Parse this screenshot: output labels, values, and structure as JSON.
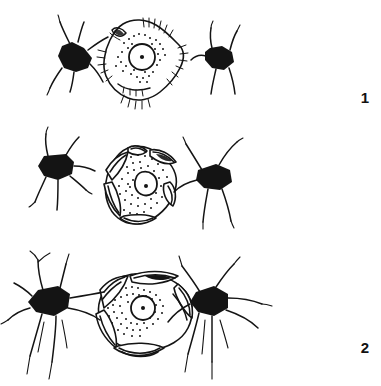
{
  "figure": {
    "background_color": "#ffffff",
    "ink_color": "#141414",
    "width": 381,
    "height": 386,
    "style": "black-and-white line drawing"
  },
  "panels": [
    {
      "label": "1",
      "caption": "Stage 1",
      "cells": [
        {
          "name": "left-stellate-cell",
          "kind": "filled-star-cell",
          "process_count": 6,
          "soma_fill": "solid-black"
        },
        {
          "name": "central-cell",
          "kind": "outlined-stippled-cell",
          "soma_fill": "white-outline",
          "nucleus": "round",
          "nucleolus": "present",
          "stipple": "sparse",
          "surface_feature": "short-hair-fringe"
        },
        {
          "name": "right-stellate-cell",
          "kind": "filled-star-cell",
          "process_count": 4,
          "soma_fill": "solid-black"
        }
      ]
    },
    {
      "label": "2",
      "caption": "Stage 2",
      "cells": [
        {
          "name": "left-stellate-cell",
          "kind": "filled-star-cell",
          "process_count": 6,
          "soma_fill": "solid-black"
        },
        {
          "name": "central-cell",
          "kind": "outlined-stippled-cell",
          "soma_fill": "white-outline",
          "nucleus": "oval",
          "nucleolus": "present",
          "stipple": "dense",
          "surface_feature": "wrapping-lamellae"
        },
        {
          "name": "right-stellate-cell",
          "kind": "filled-star-cell",
          "process_count": 5,
          "soma_fill": "solid-black"
        }
      ]
    },
    {
      "label": "3",
      "caption": "Stage 3",
      "cells": [
        {
          "name": "left-stellate-cell",
          "kind": "filled-star-cell",
          "process_count": 7,
          "soma_fill": "solid-black"
        },
        {
          "name": "central-cell",
          "kind": "outlined-stippled-cell",
          "soma_fill": "white-outline",
          "nucleus": "round",
          "nucleolus": "present",
          "stipple": "dense",
          "surface_feature": "enveloping-sheets"
        },
        {
          "name": "right-stellate-cell",
          "kind": "filled-star-cell",
          "process_count": 6,
          "soma_fill": "solid-black"
        }
      ],
      "relationship": "stellate cells contact and envelop the central cell"
    }
  ]
}
